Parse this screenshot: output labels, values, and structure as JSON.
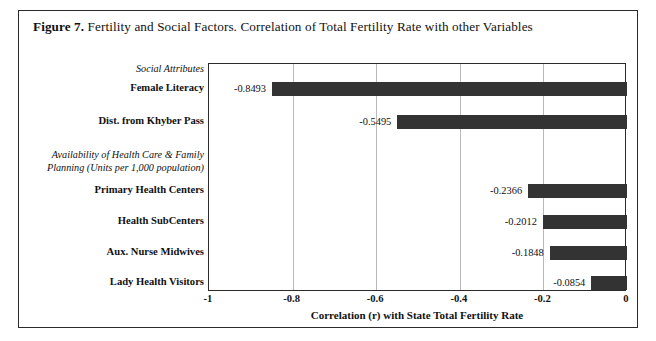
{
  "figure": {
    "caption_label": "Figure 7.",
    "caption_text": " Fertility and Social Factors. Correlation of Total Fertility Rate with other Variables"
  },
  "chart_data": {
    "type": "bar",
    "orientation": "horizontal",
    "title": "Figure 7. Fertility and Social Factors. Correlation of Total Fertility Rate with other Variables",
    "xlabel": "Correlation (r) with State Total Fertility Rate",
    "ylabel": "",
    "xlim": [
      -1,
      0
    ],
    "xticks": [
      "-1",
      "-0.8",
      "-0.6",
      "-0.4",
      "-0.2",
      "0"
    ],
    "xtick_values": [
      -1,
      -0.8,
      -0.6,
      -0.4,
      -0.2,
      0
    ],
    "grid": true,
    "legend": "none",
    "bar_color": "#333333",
    "group_headers": [
      {
        "label": "Social Attributes",
        "lines": [
          "Social Attributes"
        ],
        "style": "italic"
      },
      {
        "label": "Availability of Health Care & Family Planning (Units per 1,000 population)",
        "lines": [
          "Availability of Health Care & Family",
          "Planning (Units per 1,000 population)"
        ],
        "style": "italic"
      }
    ],
    "categories": [
      "Female Literacy",
      "Dist. from Khyber Pass",
      "Primary Health Centers",
      "Health SubCenters",
      "Aux. Nurse Midwives",
      "Lady Health Visitors"
    ],
    "values": [
      -0.8493,
      -0.5495,
      -0.2366,
      -0.2012,
      -0.1848,
      -0.0854
    ],
    "value_labels": [
      "-0.8493",
      "-0.5495",
      "-0.2366",
      "-0.2012",
      "-0.1848",
      "-0.0854"
    ]
  }
}
